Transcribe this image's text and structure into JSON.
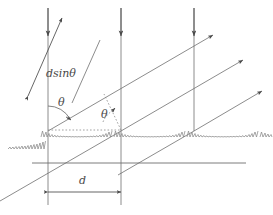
{
  "diagram": {
    "stroke_color": "#6e6e6e",
    "label_color": "#4a4a4a",
    "background": "#ffffff",
    "width": 273,
    "height": 215,
    "labels": {
      "path_difference": "dsinθ",
      "angle_incident": "θ",
      "angle_diffracted": "θ",
      "slit_spacing": "d"
    },
    "elements": {
      "incident_rays": "three vertical downward arrows",
      "diffracted_rays": "three parallel upward-right arrows",
      "grating_surface": "scalloped sawtooth grooves",
      "baseline": "horizontal reference line",
      "spacing_arrow": "double headed arrow labelled d",
      "path_arrow": "double headed arrow labelled dsinθ",
      "dotted_normal": "dotted horizontal reference at groove peaks",
      "dotted_ray": "dotted diagonal reference line"
    },
    "geometry": {
      "groove_peaks_x": [
        48,
        121,
        194
      ],
      "surface_y": 131,
      "baseline_y": 163,
      "ray_slope": -0.45,
      "spacing_d_px": 73
    }
  }
}
